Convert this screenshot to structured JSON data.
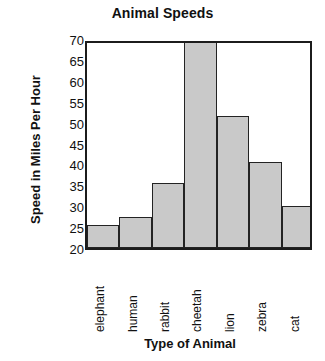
{
  "chart_data": {
    "type": "bar",
    "title": "Animal Speeds",
    "xlabel": "Type of Animal",
    "ylabel": "Speed in Miles Per Hour",
    "categories": [
      "elephant",
      "human",
      "rabbit",
      "cheetah",
      "lion",
      "zebra",
      "cat"
    ],
    "values": [
      25,
      27,
      35,
      70,
      51,
      40,
      29.5
    ],
    "ylim": [
      20,
      70
    ],
    "ytick_values": [
      70,
      65,
      60,
      55,
      50,
      45,
      40,
      35,
      30,
      25,
      20
    ],
    "ytick_labels": [
      "70",
      "65",
      "60",
      "55",
      "50",
      "45",
      "40",
      "35",
      "30",
      "25",
      "20"
    ],
    "ytick_step": 5,
    "grid": false,
    "legend": false,
    "legend_position": "none",
    "bar_fill_color": "#c9c9c9",
    "bar_edge_color": "#232323",
    "axis_color": "#1c1c1c",
    "background_color": "#ffffff"
  }
}
